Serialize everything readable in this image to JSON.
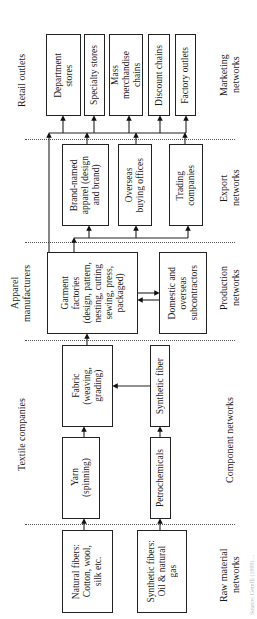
{
  "tiers": {
    "retail_outlets": "Retail outlets",
    "apparel_manufacturers": "Apparel\nmanufacturers",
    "textile_companies": "Textile companies",
    "raw_material_networks": "Raw material\nnetworks"
  },
  "networks": {
    "marketing": "Marketing\nnetworks",
    "export": "Export\nnetworks",
    "production": "Production\nnetworks",
    "component": "Component networks"
  },
  "boxes": {
    "department_stores": "Department\nstores",
    "specialty_stores": "Specialty stores",
    "mass_merchandise": "Mass\nmerchandise\nchains",
    "discount_chains": "Discount chains",
    "factory_outlets": "Factory outlets",
    "brand_named": "Brand-named\napparel (design\nand brand)",
    "overseas_buying": "Overseas\nbuying offices",
    "trading_companies": "Trading\ncompanies",
    "garment_factories": "Garment\nfactories\n(design, pattern,\nnesting, cutting\nsewing, press,\npackaged)",
    "subcontractors": "Domestic and\noverseas\nsubcontractors",
    "fabric": "Fabric\n(weaving,\ngrading)",
    "synthetic_fiber": "Synthetic fiber",
    "yarn": "Yarn\n(spinning)",
    "petrochemicals": "Petrochemicals",
    "natural_fibers": "Natural fibers:\nCotton, wool,\nsilk etc.",
    "synthetic_fibers": "Synthetic fibers:\nOil & natural\ngas"
  },
  "source_note": "Source: Gereffi (1999) ..."
}
